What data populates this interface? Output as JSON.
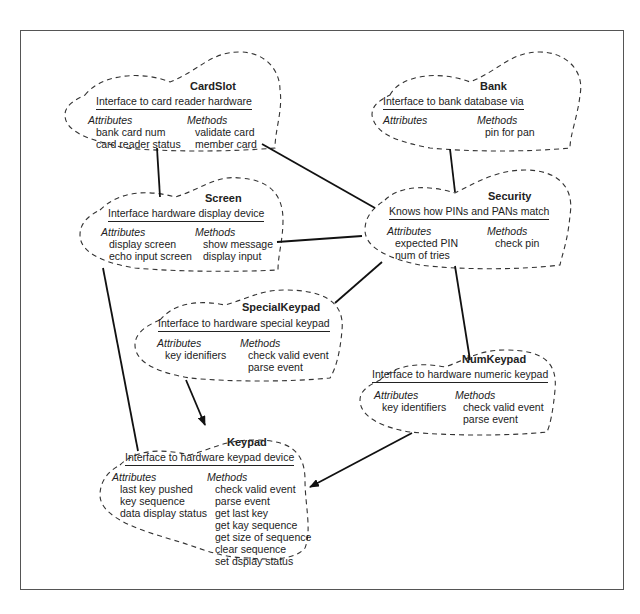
{
  "diagram": {
    "type": "class-responsibility clouds (ATM)",
    "classes": {
      "cardslot": {
        "name": "CardSlot",
        "description": "Interface to card reader hardware",
        "attributes_label": "Attributes",
        "attributes": [
          "bank card num",
          "card reader status"
        ],
        "methods_label": "Methods",
        "methods": [
          "validate card",
          "member card"
        ]
      },
      "bank": {
        "name": "Bank",
        "description": "Interface to bank database via",
        "attributes_label": "Attributes",
        "attributes": [],
        "methods_label": "Methods",
        "methods": [
          "pin for pan"
        ]
      },
      "screen": {
        "name": "Screen",
        "description": "Interface hardware display device",
        "attributes_label": "Attributes",
        "attributes": [
          "display screen",
          "echo input screen"
        ],
        "methods_label": "Methods",
        "methods": [
          "show message",
          "display input"
        ]
      },
      "security": {
        "name": "Security",
        "description": "Knows how PINs and PANs match",
        "attributes_label": "Attributes",
        "attributes": [
          "expected PIN",
          "num of tries"
        ],
        "methods_label": "Methods",
        "methods": [
          "check pin"
        ]
      },
      "specialkeypad": {
        "name": "SpecialKeypad",
        "description": "Interface to hardware special keypad",
        "attributes_label": "Attributes",
        "attributes": [
          "key idenifiers"
        ],
        "methods_label": "Methods",
        "methods": [
          "check valid event",
          "parse event"
        ]
      },
      "numkeypad": {
        "name": "NumKeypad",
        "description": "Interface to hardware numeric keypad",
        "attributes_label": "Attributes",
        "attributes": [
          "key identifiers"
        ],
        "methods_label": "Methods",
        "methods": [
          "check valid event",
          "parse event"
        ]
      },
      "keypad": {
        "name": "Keypad",
        "description": "Interface to hardware keypad device",
        "attributes_label": "Attributes",
        "attributes": [
          "last key pushed",
          "key sequence",
          "data display status"
        ],
        "methods_label": "Methods",
        "methods": [
          "check valid event",
          "parse event",
          "get last key",
          "get kay sequence",
          "get size of sequence",
          "clear sequence",
          "set dsplay status"
        ]
      }
    },
    "associations": [
      {
        "from": "CardSlot",
        "to": "Screen",
        "kind": "line"
      },
      {
        "from": "CardSlot",
        "to": "Security",
        "kind": "line"
      },
      {
        "from": "Bank",
        "to": "Security",
        "kind": "line"
      },
      {
        "from": "Screen",
        "to": "Security",
        "kind": "line"
      },
      {
        "from": "Security",
        "to": "SpecialKeypad",
        "kind": "line"
      },
      {
        "from": "Security",
        "to": "NumKeypad",
        "kind": "line"
      },
      {
        "from": "Screen",
        "to": "Keypad",
        "kind": "line"
      },
      {
        "from": "SpecialKeypad",
        "to": "Keypad",
        "kind": "arrow"
      },
      {
        "from": "NumKeypad",
        "to": "Keypad",
        "kind": "arrow"
      }
    ]
  }
}
